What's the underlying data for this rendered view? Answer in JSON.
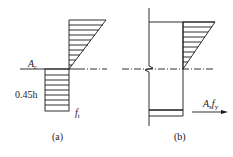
{
  "figure_a": {
    "caption": "(a)",
    "label_neutral_axis_main": "A",
    "label_neutral_axis_sub": "c",
    "label_depth": "0.45h",
    "label_stress_main": "f",
    "label_stress_sub": "t"
  },
  "figure_b": {
    "caption": "(b)",
    "label_force_A": "A",
    "label_force_A_sub": "s",
    "label_force_f": "f",
    "label_force_f_sub": "y"
  },
  "colors": {
    "line": "#1a1a1a",
    "background": "#ffffff"
  }
}
